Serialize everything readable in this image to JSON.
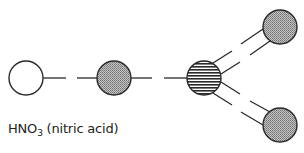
{
  "diagram": {
    "label": {
      "formula_prefix": "HNO",
      "formula_subscript": "3",
      "name": " (nitric acid)"
    },
    "atoms": [
      {
        "id": "H",
        "element": "hydrogen",
        "fill": "white",
        "cx": 26,
        "cy": 78
      },
      {
        "id": "O1",
        "element": "oxygen",
        "fill": "stipple-gray",
        "cx": 114,
        "cy": 78
      },
      {
        "id": "N",
        "element": "nitrogen",
        "fill": "horizontal-hatch",
        "cx": 204,
        "cy": 78
      },
      {
        "id": "O2",
        "element": "oxygen",
        "fill": "stipple-gray",
        "cx": 280,
        "cy": 27
      },
      {
        "id": "O3",
        "element": "oxygen",
        "fill": "stipple-gray",
        "cx": 280,
        "cy": 125
      }
    ],
    "bonds": [
      {
        "from": "H",
        "to": "O1",
        "type": "single-dashed"
      },
      {
        "from": "O1",
        "to": "N",
        "type": "single"
      },
      {
        "from": "N",
        "to": "O2",
        "type": "double-dashed"
      },
      {
        "from": "N",
        "to": "O3",
        "type": "double-dashed"
      }
    ],
    "colors": {
      "stroke": "#2a2a2a",
      "stipple": "#9a9a9a",
      "hatch": "#2a2a2a"
    }
  }
}
